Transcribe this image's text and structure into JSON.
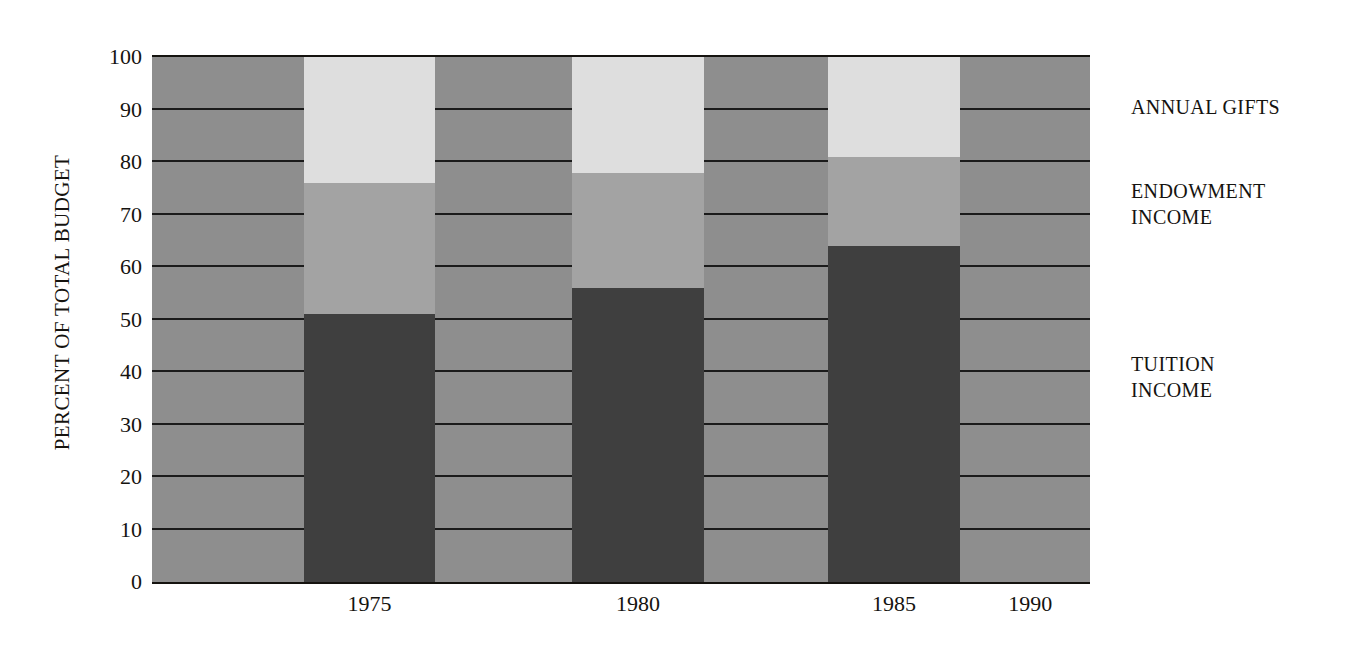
{
  "chart_data": {
    "type": "bar",
    "stacked": true,
    "title": "",
    "subtitle": "",
    "xlabel": "",
    "ylabel": "PERCENT OF TOTAL BUDGET",
    "categories": [
      "1975",
      "1980",
      "1985",
      "1990"
    ],
    "ylim": [
      0,
      100
    ],
    "yticks": [
      0,
      10,
      20,
      30,
      40,
      50,
      60,
      70,
      80,
      90,
      100
    ],
    "ytick_labels": [
      "0",
      "10",
      "20",
      "30",
      "40",
      "50",
      "60",
      "70",
      "80",
      "90",
      "100"
    ],
    "grid": true,
    "grid_axis": "y",
    "legend_position": "right",
    "series": [
      {
        "name": "TUITION INCOME",
        "color": "#3f3f3f",
        "values": [
          51,
          56,
          64,
          63
        ]
      },
      {
        "name": "ENDOWMENT INCOME",
        "color": "#a3a3a3",
        "values": [
          25,
          22,
          17,
          20
        ]
      },
      {
        "name": "ANNUAL GIFTS",
        "color": "#dedede",
        "values": [
          24,
          22,
          19,
          17
        ]
      }
    ],
    "cumulative_tops": {
      "TUITION INCOME": [
        51,
        56,
        64,
        63
      ],
      "ENDOWMENT INCOME": [
        76,
        78,
        81,
        83
      ],
      "ANNUAL GIFTS": [
        100,
        100,
        100,
        100
      ]
    },
    "annotations": []
  },
  "legend": {
    "entries": [
      {
        "label": "ANNUAL GIFTS",
        "top_pct": 7
      },
      {
        "label": "ENDOWMENT\nINCOME",
        "top_pct": 23
      },
      {
        "label": "TUITION\nINCOME",
        "top_pct": 56
      }
    ]
  },
  "colors": {
    "background": "#ffffff",
    "plot_background": "#8e8e8e",
    "gridline": "#1b1b1b",
    "axis": "#15130f",
    "text": "#15130f",
    "tuition": "#3f3f3f",
    "endowment": "#a3a3a3",
    "annual_gifts": "#dedede"
  },
  "bar_geometry": {
    "bar_width_pct": 14.0,
    "centers_pct": [
      23.2,
      51.8,
      79.1,
      109.2
    ]
  }
}
